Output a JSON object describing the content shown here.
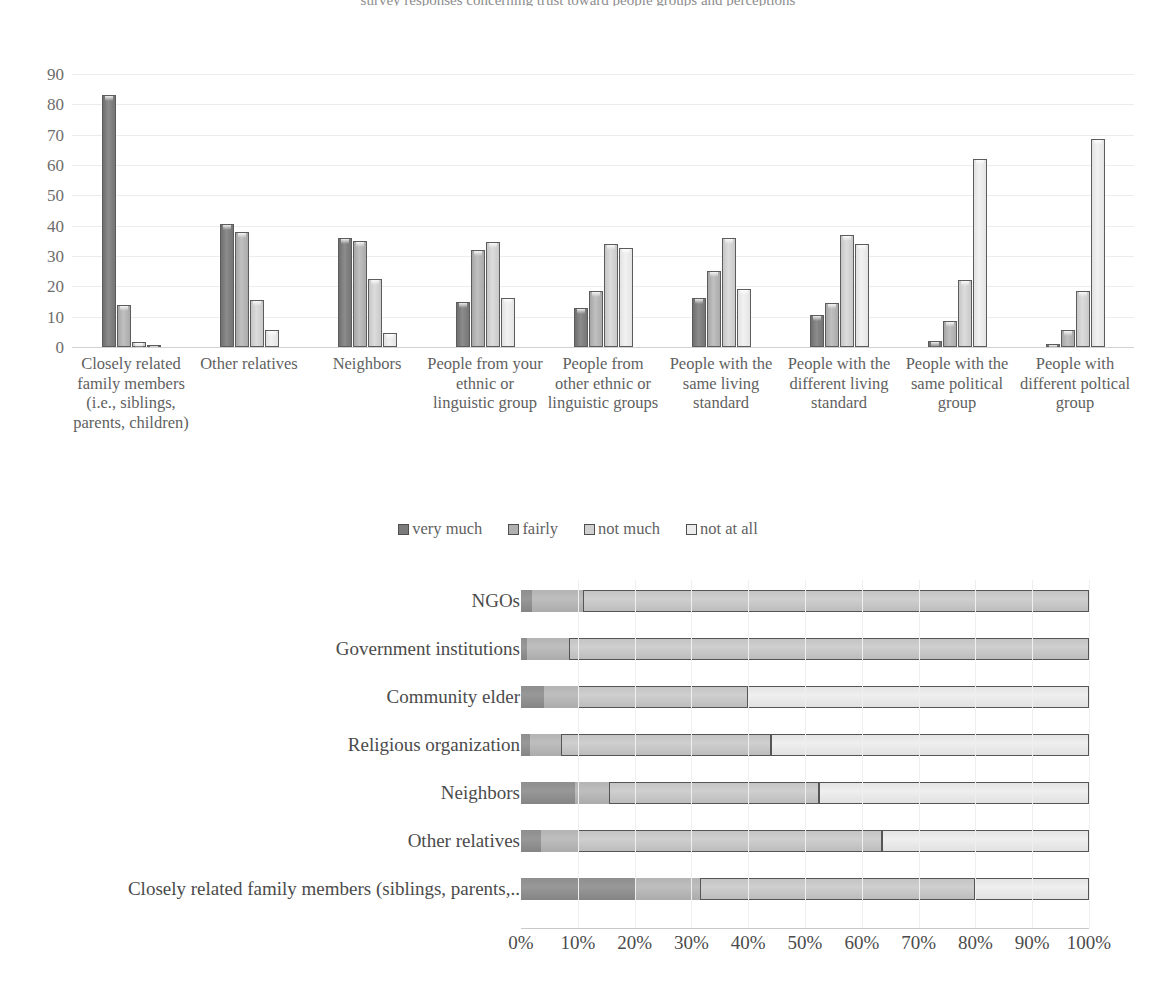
{
  "top_caption": "survey responses concerning trust toward people groups and perceptions",
  "chart_data": [
    {
      "type": "bar",
      "orientation": "vertical",
      "title": "",
      "xlabel": "",
      "ylabel": "",
      "ylim": [
        0,
        90
      ],
      "yticks": [
        0,
        10,
        20,
        30,
        40,
        50,
        60,
        70,
        80,
        90
      ],
      "grid": true,
      "legend_position": "bottom",
      "categories": [
        "Closely related family members (i.e., siblings, parents, children)",
        "Other relatives",
        "Neighbors",
        "People from your ethnic or linguistic group",
        "People from other ethnic or linguistic groups",
        "People with the same living standard",
        "People with the different living standard",
        "People with the same political group",
        "People with different poltical group"
      ],
      "series": [
        {
          "name": "very much",
          "values": [
            83,
            40.5,
            36,
            15,
            13,
            16,
            10.5,
            2,
            1
          ]
        },
        {
          "name": "fairly",
          "values": [
            14,
            38,
            35,
            32,
            18.5,
            25,
            14.5,
            8.5,
            5.5
          ]
        },
        {
          "name": "not much",
          "values": [
            1.5,
            15.5,
            22.5,
            34.5,
            34,
            36,
            37,
            22,
            18.5
          ]
        },
        {
          "name": "not at all",
          "values": [
            0.8,
            5.5,
            4.5,
            16,
            32.5,
            19,
            34,
            62,
            68.5
          ]
        }
      ]
    },
    {
      "type": "bar",
      "orientation": "horizontal",
      "stacked": true,
      "title": "",
      "xlabel": "",
      "ylabel": "",
      "xlim": [
        0,
        100
      ],
      "xticks": [
        "0%",
        "10%",
        "20%",
        "30%",
        "40%",
        "50%",
        "60%",
        "70%",
        "80%",
        "90%",
        "100%"
      ],
      "grid": true,
      "categories": [
        "NGOs",
        "Government institutions",
        "Community elder",
        "Religious organization",
        "Neighbors",
        "Other relatives",
        "Closely related family members (siblings, parents,.."
      ],
      "series": [
        {
          "name": "series-1",
          "values": [
            2.0,
            1.0,
            4.0,
            1.5,
            9.5,
            3.5,
            20.0
          ]
        },
        {
          "name": "series-2",
          "values": [
            9.0,
            7.5,
            6.0,
            5.5,
            6.0,
            6.5,
            11.5
          ]
        },
        {
          "name": "series-3",
          "values": [
            89.0,
            91.5,
            30.0,
            37.0,
            37.0,
            53.5,
            48.5
          ]
        },
        {
          "name": "series-4",
          "values": [
            0.0,
            0.0,
            60.0,
            56.0,
            47.5,
            36.5,
            20.0
          ]
        }
      ]
    }
  ],
  "chart1": {
    "legend": [
      {
        "label": "very much"
      },
      {
        "label": "fairly"
      },
      {
        "label": "not much"
      },
      {
        "label": "not at all"
      }
    ],
    "yticks": [
      "90",
      "80",
      "70",
      "60",
      "50",
      "40",
      "30",
      "20",
      "10",
      "0"
    ],
    "categories": [
      "Closely related family members (i.e., siblings, parents, children)",
      "Other relatives",
      "Neighbors",
      "People from your ethnic or linguistic group",
      "People from other ethnic or linguistic groups",
      "People with the same living standard",
      "People with the different living standard",
      "People with the same political group",
      "People with different poltical group"
    ]
  },
  "chart2": {
    "row_labels": [
      "NGOs",
      "Government institutions",
      "Community elder",
      "Religious organization",
      "Neighbors",
      "Other relatives",
      "Closely related family members (siblings, parents,.."
    ],
    "xticks": [
      "0%",
      "10%",
      "20%",
      "30%",
      "40%",
      "50%",
      "60%",
      "70%",
      "80%",
      "90%",
      "100%"
    ]
  }
}
